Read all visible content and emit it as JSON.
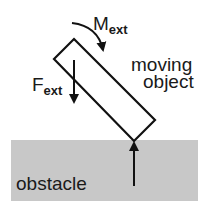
{
  "diagram": {
    "labels": {
      "moment_main": "M",
      "moment_sub": "ext",
      "force_main": "F",
      "force_sub": "ext",
      "object_line1": "moving",
      "object_line2": "object",
      "obstacle": "obstacle"
    },
    "colors": {
      "stroke": "#111111",
      "obstacle_fill": "#c8c8c8",
      "background": "#ffffff"
    },
    "elements": [
      {
        "id": "moving-object",
        "shape": "rotated-rectangle",
        "corners": [
          [
            74,
            39
          ],
          [
            155,
            120
          ],
          [
            134,
            141
          ],
          [
            54,
            59
          ]
        ]
      },
      {
        "id": "obstacle",
        "shape": "rectangle",
        "x": 11,
        "y": 140,
        "width": 187,
        "height": 61
      },
      {
        "id": "external-moment",
        "shape": "curved-arrow",
        "direction": "clockwise"
      },
      {
        "id": "external-force",
        "shape": "arrow",
        "direction": "down"
      },
      {
        "id": "contact-force",
        "shape": "arrow",
        "direction": "up"
      }
    ]
  }
}
